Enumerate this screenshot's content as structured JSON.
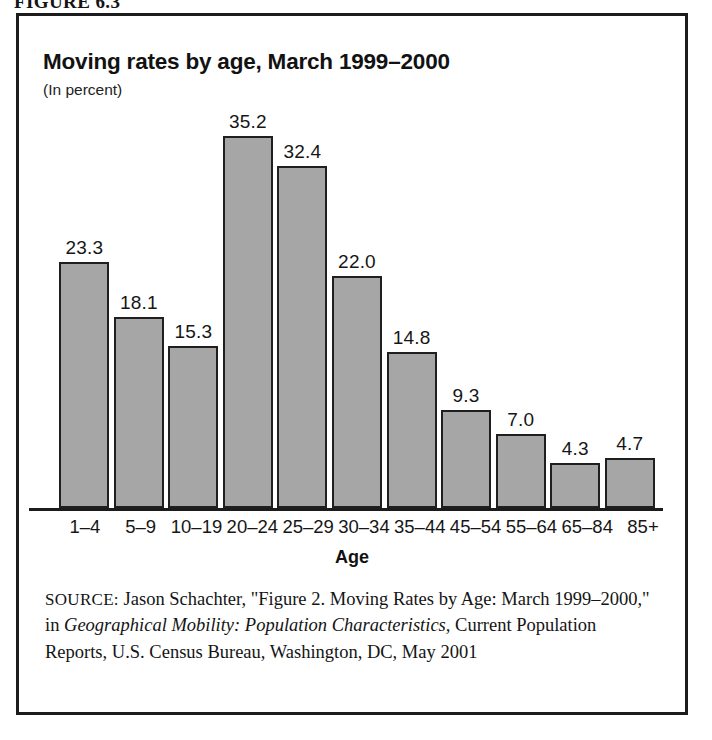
{
  "figure": {
    "label": "FIGURE 6.3"
  },
  "chart_data": {
    "type": "bar",
    "title": "Moving rates by age, March 1999–2000",
    "subtitle": "(In percent)",
    "xlabel": "Age",
    "ylabel": "",
    "units": "percent",
    "grid": false,
    "legend": "none",
    "ylim": [
      0,
      35.2
    ],
    "categories": [
      "1–4",
      "5–9",
      "10–19",
      "20–24",
      "25–29",
      "30–34",
      "35–44",
      "45–54",
      "55–64",
      "65–84",
      "85+"
    ],
    "values": [
      23.3,
      18.1,
      15.3,
      35.2,
      32.4,
      22.0,
      14.8,
      9.3,
      7.0,
      4.3,
      4.7
    ],
    "value_labels": [
      "23.3",
      "18.1",
      "15.3",
      "35.2",
      "32.4",
      "22.0",
      "14.8",
      "9.3",
      "7.0",
      "4.3",
      "4.7"
    ],
    "bar_color": "#a6a6a6",
    "bar_border_color": "#1f1f1f"
  },
  "source": {
    "label": "SOURCE:",
    "text_part1": " Jason Schachter, \"Figure 2. Moving Rates by Age: March 1999–2000,\" in ",
    "italic_title": "Geographical Mobility: Population Characteristics,",
    "text_part2": " Current Population Reports, U.S. Census Bureau, Washington, DC, May 2001"
  },
  "colors": {
    "frame": "#1c1c1c",
    "text": "#141414",
    "bar_fill": "#a6a6a6"
  }
}
